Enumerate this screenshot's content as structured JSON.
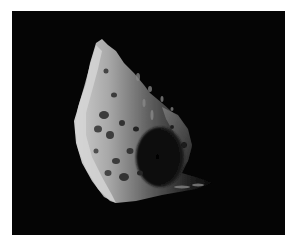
{
  "image": {
    "subject": "Cratered irregular moon against black space",
    "alt": "Grayscale photo of a heavily cratered, irregularly shaped small moon lit from the left, with a large shadowed crater on its right side",
    "colors": {
      "page_background": "#ffffff",
      "space_background": "#050505",
      "surface_highlight": "#d8d8d8",
      "surface_mid": "#8a8a8a",
      "surface_shadow": "#2a2a2a"
    }
  }
}
